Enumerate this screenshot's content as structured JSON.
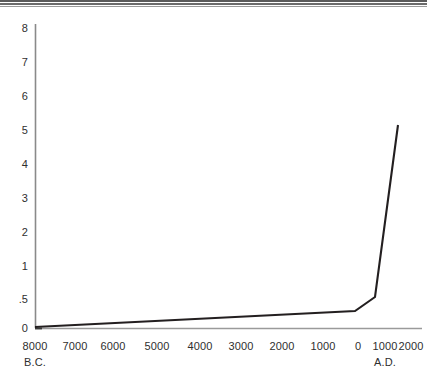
{
  "figure": {
    "name": "world-population-growth-curve",
    "has_top_rule": true,
    "background_color": "#ffffff",
    "line_color": "#231f20",
    "axis_color": "#7b7b7b",
    "text_color": "#2f2f2f"
  },
  "chart_data": {
    "type": "line",
    "title": "",
    "subtitle": "",
    "xlabel": "",
    "ylabel": "",
    "grid": false,
    "legend": null,
    "x_tick_labels": [
      "8000",
      "7000",
      "6000",
      "5000",
      "4000",
      "3000",
      "2000",
      "1000",
      "0",
      "1000",
      "2000"
    ],
    "x_era_labels": [
      {
        "text": "B.C.",
        "under_tick_index": 0
      },
      {
        "text": "A.D.",
        "under_tick_index": 9
      }
    ],
    "y_tick_labels": [
      "8",
      "7",
      "6",
      "5",
      "4",
      "3",
      "2",
      "1",
      ".5",
      "0"
    ],
    "y_tick_values": [
      8,
      7,
      6,
      5,
      4,
      3,
      2,
      1,
      0.5,
      0
    ],
    "y_axis_note": "Non-linear break below 1: the .5 tick occupies a full tick interval between 1 and 0.",
    "ylim": [
      0,
      8
    ],
    "xlim": [
      "8000 B.C.",
      "2000 A.D."
    ],
    "x": [
      "8000 B.C.",
      "1000 A.D.",
      "2000 A.D."
    ],
    "values": [
      0.0,
      0.5,
      5.0
    ],
    "series": [
      {
        "name": "World population (billions)",
        "points": [
          {
            "x": "8000 B.C.",
            "y": 0.0
          },
          {
            "x": "1000 A.D.",
            "y": 0.5
          },
          {
            "x": "2000 A.D.",
            "y": 5.0
          }
        ]
      }
    ],
    "annotations": []
  },
  "axis_geometry": {
    "plot_left": 35,
    "plot_right": 422,
    "plot_top": 24,
    "plot_bottom": 328,
    "y_ticks_px": [
      28,
      62,
      96,
      130,
      164,
      198,
      232,
      266,
      300,
      328
    ],
    "x_ticks_px": [
      35,
      72,
      109,
      146,
      183,
      220,
      257,
      294,
      331,
      368,
      405
    ],
    "curve_px": [
      {
        "x": 35,
        "y": 327
      },
      {
        "x": 355,
        "y": 311
      },
      {
        "x": 375,
        "y": 297
      },
      {
        "x": 398,
        "y": 125
      }
    ]
  }
}
